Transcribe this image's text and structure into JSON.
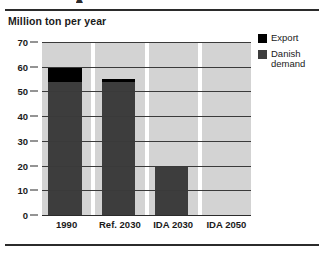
{
  "figure": {
    "cut_glyph": "▴",
    "title": "Million ton per year"
  },
  "legend": {
    "items": [
      {
        "label": "Export",
        "color": "#000000",
        "swatch_name": "legend-swatch-export"
      },
      {
        "label": "Danish demand",
        "color": "#3d3d3d",
        "swatch_name": "legend-swatch-danish-demand"
      }
    ]
  },
  "axis": {
    "y_ticks": [
      "70",
      "60",
      "50",
      "40",
      "30",
      "20",
      "10",
      "0"
    ],
    "x_ticks": [
      "1990",
      "Ref. 2030",
      "IDA 2030",
      "IDA 2050"
    ]
  },
  "chart_data": {
    "type": "bar",
    "title": "Million ton per year",
    "xlabel": "",
    "ylabel": "Million ton per year",
    "ylim": [
      0,
      70
    ],
    "ytick_step": 10,
    "grid": true,
    "stacked": true,
    "legend_position": "right",
    "categories": [
      "1990",
      "Ref. 2030",
      "IDA 2030",
      "IDA 2050"
    ],
    "series": [
      {
        "name": "Danish demand",
        "color": "#3d3d3d",
        "values": [
          54,
          54,
          20,
          0
        ]
      },
      {
        "name": "Export",
        "color": "#000000",
        "values": [
          6,
          1,
          0,
          0
        ]
      }
    ],
    "totals": [
      60,
      55,
      20,
      0
    ]
  }
}
